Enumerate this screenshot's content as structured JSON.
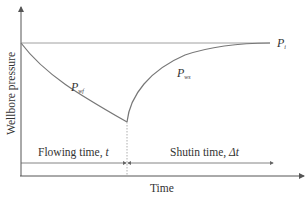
{
  "diagram": {
    "type": "pressure-buildup-schematic",
    "axes": {
      "y_label": "Wellbore pressure",
      "x_label": "Time"
    },
    "curves": [
      {
        "name": "drawdown",
        "label_main": "P",
        "label_sub": "wf"
      },
      {
        "name": "buildup",
        "label_main": "P",
        "label_sub": "ws"
      }
    ],
    "reference_line": {
      "label_main": "P",
      "label_sub": "i"
    },
    "periods": [
      {
        "name": "flowing",
        "label": "Flowing time, ",
        "var": "t"
      },
      {
        "name": "shutin",
        "label": "Shutin time, ",
        "var": "Δt"
      }
    ],
    "colors": {
      "axis": "#555555",
      "curve": "#777777",
      "reference": "#888888",
      "text": "#333333"
    }
  }
}
